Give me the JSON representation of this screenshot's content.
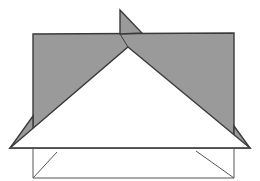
{
  "figure": {
    "canvas": {
      "width": 260,
      "height": 181
    },
    "colors": {
      "background": "#ffffff",
      "fill_gray": "#9a9a9a",
      "stroke_dark": "#3a3a3a",
      "stroke_thin": "#555555",
      "white_fill": "#ffffff"
    },
    "stroke_widths": {
      "thick": 1.4,
      "thin": 1.0
    },
    "shapes": [
      {
        "name": "gray-rectangle",
        "kind": "polygon",
        "fill": "#9a9a9a",
        "stroke": "#3a3a3a",
        "points": "33,34 234,33 234,148 33,148"
      },
      {
        "name": "left-gray-wing",
        "kind": "polygon",
        "fill": "#9a9a9a",
        "stroke": "#3a3a3a",
        "points": "10,148 33,148 33,116"
      },
      {
        "name": "right-gray-wing",
        "kind": "polygon",
        "fill": "#9a9a9a",
        "stroke": "#3a3a3a",
        "points": "250,148 234,148 234,126"
      },
      {
        "name": "top-gray-spike",
        "kind": "polygon",
        "fill": "#9a9a9a",
        "stroke": "#3a3a3a",
        "points": "120,10 120,34 142,33"
      },
      {
        "name": "large-white-triangle",
        "kind": "polygon",
        "fill": "#ffffff",
        "stroke": "#3a3a3a",
        "points": "128,47 250,148 10,148"
      },
      {
        "name": "base-top-edge",
        "kind": "line",
        "stroke": "#555555",
        "x1": 10,
        "y1": 148,
        "x2": 250,
        "y2": 148
      },
      {
        "name": "base-left-vertical",
        "kind": "line",
        "stroke": "#555555",
        "x1": 33,
        "y1": 148,
        "x2": 33,
        "y2": 178
      },
      {
        "name": "base-right-vertical",
        "kind": "line",
        "stroke": "#555555",
        "x1": 234,
        "y1": 148,
        "x2": 234,
        "y2": 178
      },
      {
        "name": "base-left-diagonal",
        "kind": "line",
        "stroke": "#555555",
        "x1": 33,
        "y1": 178,
        "x2": 57,
        "y2": 152
      },
      {
        "name": "base-right-diagonal",
        "kind": "line",
        "stroke": "#555555",
        "x1": 196,
        "y1": 151,
        "x2": 234,
        "y2": 178
      },
      {
        "name": "base-bottom-edge",
        "kind": "line",
        "stroke": "#555555",
        "x1": 33,
        "y1": 178,
        "x2": 234,
        "y2": 178
      },
      {
        "name": "spike-stem",
        "kind": "line",
        "stroke": "#3a3a3a",
        "x1": 120,
        "y1": 34,
        "x2": 128,
        "y2": 47
      }
    ]
  }
}
